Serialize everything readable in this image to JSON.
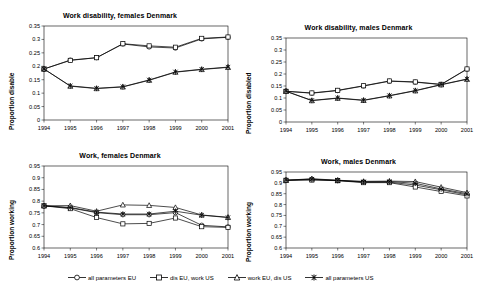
{
  "chart_data": [
    {
      "id": "work-disability-females-denmark",
      "type": "line",
      "title": "Work disability, females Denmark",
      "xlabel": "",
      "ylabel": "Proportion disable",
      "x": [
        "1994",
        "1995",
        "1996",
        "1997",
        "1998",
        "1999",
        "2000",
        "2001"
      ],
      "ylim": [
        0,
        0.35
      ],
      "yticks": [
        "0",
        "0.05",
        "0.1",
        "0.15",
        "0.2",
        "0.25",
        "0.3",
        "0.35"
      ],
      "grid": false,
      "legend_position": "bottom-shared",
      "series": [
        {
          "name": "all parameters EU",
          "marker": "circle",
          "values": [
            0.19,
            0.223,
            0.232,
            0.283,
            0.272,
            0.268,
            0.302,
            0.308
          ]
        },
        {
          "name": "dis EU, work US",
          "marker": "square",
          "values": [
            0.19,
            0.222,
            0.232,
            0.284,
            0.276,
            0.271,
            0.304,
            0.309
          ]
        },
        {
          "name": "work EU, dis US",
          "marker": "triangle",
          "values": [
            0.19,
            0.126,
            0.117,
            0.123,
            0.148,
            0.178,
            0.188,
            0.196
          ]
        },
        {
          "name": "all parameters US",
          "marker": "cross",
          "values": [
            0.19,
            0.127,
            0.118,
            0.124,
            0.149,
            0.179,
            0.189,
            0.197
          ]
        }
      ]
    },
    {
      "id": "work-disability-males-denmark",
      "type": "line",
      "title": "Work disability, males Denmark",
      "xlabel": "",
      "ylabel": "Proportion disabled",
      "x": [
        "1994",
        "1995",
        "1996",
        "1997",
        "1998",
        "1999",
        "2000",
        "2001"
      ],
      "ylim": [
        0,
        0.35
      ],
      "yticks": [
        "0",
        "0.05",
        "0.1",
        "0.15",
        "0.2",
        "0.25",
        "0.3",
        "0.35"
      ],
      "grid": false,
      "legend_position": "bottom-shared",
      "series": [
        {
          "name": "all parameters EU",
          "marker": "circle",
          "values": [
            0.128,
            0.12,
            0.131,
            0.15,
            0.17,
            0.166,
            0.156,
            0.22
          ]
        },
        {
          "name": "dis EU, work US",
          "marker": "square",
          "values": [
            0.128,
            0.121,
            0.132,
            0.151,
            0.171,
            0.167,
            0.157,
            0.221
          ]
        },
        {
          "name": "work EU, dis US",
          "marker": "triangle",
          "values": [
            0.128,
            0.089,
            0.099,
            0.09,
            0.109,
            0.13,
            0.155,
            0.178
          ]
        },
        {
          "name": "all parameters US",
          "marker": "cross",
          "values": [
            0.128,
            0.09,
            0.1,
            0.091,
            0.11,
            0.131,
            0.156,
            0.179
          ]
        }
      ]
    },
    {
      "id": "work-females-denmark",
      "type": "line",
      "title": "Work, females Denmark",
      "xlabel": "",
      "ylabel": "Proportion working",
      "x": [
        "1994",
        "1995",
        "1996",
        "1997",
        "1998",
        "1999",
        "2000",
        "2001"
      ],
      "ylim": [
        0.6,
        0.95
      ],
      "yticks": [
        "0.6",
        "0.65",
        "0.7",
        "0.75",
        "0.8",
        "0.85",
        "0.9",
        "0.95"
      ],
      "grid": false,
      "legend_position": "bottom-shared",
      "series": [
        {
          "name": "all parameters EU",
          "marker": "circle",
          "values": [
            0.78,
            0.771,
            0.751,
            0.742,
            0.742,
            0.751,
            0.697,
            0.69
          ]
        },
        {
          "name": "dis EU, work US",
          "marker": "square",
          "values": [
            0.78,
            0.768,
            0.73,
            0.703,
            0.705,
            0.728,
            0.691,
            0.688
          ]
        },
        {
          "name": "work EU, dis US",
          "marker": "triangle",
          "values": [
            0.78,
            0.781,
            0.757,
            0.784,
            0.782,
            0.773,
            0.741,
            0.731
          ]
        },
        {
          "name": "all parameters US",
          "marker": "cross",
          "values": [
            0.78,
            0.773,
            0.753,
            0.745,
            0.745,
            0.757,
            0.74,
            0.73
          ]
        }
      ]
    },
    {
      "id": "work-males-denmark",
      "type": "line",
      "title": "Work, males Denmark",
      "xlabel": "",
      "ylabel": "Proportion working",
      "x": [
        "1994",
        "1995",
        "1996",
        "1997",
        "1998",
        "1999",
        "2000",
        "2001"
      ],
      "ylim": [
        0.6,
        0.95
      ],
      "yticks": [
        "0.6",
        "0.65",
        "0.7",
        "0.75",
        "0.8",
        "0.85",
        "0.9",
        "0.95"
      ],
      "grid": false,
      "legend_position": "bottom-shared",
      "series": [
        {
          "name": "all parameters EU",
          "marker": "circle",
          "values": [
            0.912,
            0.915,
            0.911,
            0.903,
            0.903,
            0.89,
            0.868,
            0.845
          ]
        },
        {
          "name": "dis EU, work US",
          "marker": "square",
          "values": [
            0.912,
            0.913,
            0.91,
            0.901,
            0.901,
            0.881,
            0.86,
            0.84
          ]
        },
        {
          "name": "work EU, dis US",
          "marker": "triangle",
          "values": [
            0.912,
            0.919,
            0.912,
            0.907,
            0.908,
            0.906,
            0.88,
            0.855
          ]
        },
        {
          "name": "all parameters US",
          "marker": "cross",
          "values": [
            0.912,
            0.917,
            0.911,
            0.905,
            0.906,
            0.898,
            0.872,
            0.85
          ]
        }
      ]
    }
  ],
  "legend": {
    "items": [
      {
        "label": "all parameters EU",
        "marker": "circle"
      },
      {
        "label": "dis EU, work US",
        "marker": "square"
      },
      {
        "label": "work EU, dis US",
        "marker": "triangle"
      },
      {
        "label": "all parameters US",
        "marker": "cross"
      }
    ]
  }
}
